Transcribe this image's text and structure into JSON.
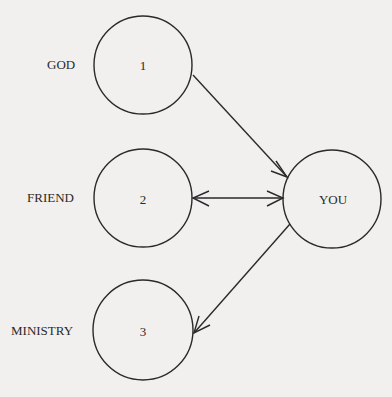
{
  "diagram": {
    "nodes": [
      {
        "id": "1",
        "number": "1",
        "label": "GOD",
        "cx": 143,
        "cy": 65,
        "r": 49
      },
      {
        "id": "2",
        "number": "2",
        "label": "FRIEND",
        "cx": 143,
        "cy": 198,
        "r": 49
      },
      {
        "id": "3",
        "number": "3",
        "label": "MINISTRY",
        "cx": 143,
        "cy": 330,
        "r": 50
      },
      {
        "id": "you",
        "label": "YOU",
        "cx": 332,
        "cy": 199,
        "r": 49
      }
    ],
    "edges": [
      {
        "from": "1",
        "to": "you",
        "type": "directed"
      },
      {
        "from": "2",
        "to": "you",
        "type": "bidirectional"
      },
      {
        "from": "you",
        "to": "3",
        "type": "directed"
      }
    ],
    "colors": {
      "stroke": "#2a2a2a",
      "background": "#f1f0ee"
    }
  }
}
